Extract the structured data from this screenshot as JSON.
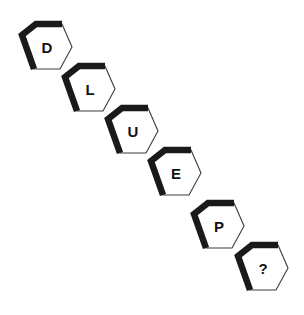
{
  "puzzle": {
    "type": "letter-sequence-hexagons",
    "background_color": "#ffffff",
    "hex_fill_color": "#ffffff",
    "hex_thick_stroke_color": "#1a1a1a",
    "hex_thin_stroke_color": "#3c3c3c",
    "letter_color": "#141414",
    "cells": [
      {
        "label": "D",
        "x": 18,
        "y": 22
      },
      {
        "label": "L",
        "x": 61,
        "y": 64
      },
      {
        "label": "U",
        "x": 104,
        "y": 106
      },
      {
        "label": "E",
        "x": 147,
        "y": 148
      },
      {
        "label": "P",
        "x": 190,
        "y": 201
      },
      {
        "label": "?",
        "x": 234,
        "y": 243
      }
    ]
  }
}
